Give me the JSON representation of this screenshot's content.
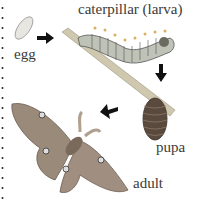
{
  "diagram": {
    "stages": [
      {
        "id": "egg",
        "label": "egg"
      },
      {
        "id": "larva",
        "label": "caterpillar (larva)"
      },
      {
        "id": "pupa",
        "label": "pupa"
      },
      {
        "id": "adult",
        "label": "adult"
      }
    ],
    "arrows": [
      {
        "from": "egg",
        "to": "larva",
        "direction": "right"
      },
      {
        "from": "larva",
        "to": "pupa",
        "direction": "down"
      },
      {
        "from": "pupa",
        "to": "adult",
        "direction": "left"
      }
    ],
    "colors": {
      "text": "#3a3a3a",
      "arrow": "#111111",
      "branch": "#c8c1a8",
      "caterpillar": "#b9bcb0",
      "pupa": "#5a4a3e",
      "moth": "#8f7f70",
      "border_dots": "#222222"
    }
  }
}
